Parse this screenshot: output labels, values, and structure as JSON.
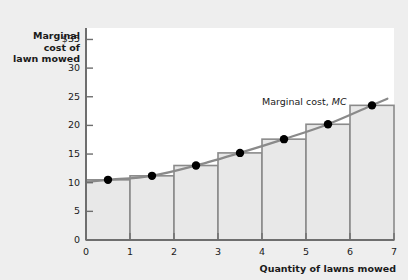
{
  "axes": {
    "y_title": "Marginal\ncost of\nlawn mowed",
    "x_title": "Quantity of lawns mowed",
    "curve_label_prefix": "Marginal cost, ",
    "curve_label_symbol": "MC"
  },
  "colors": {
    "background": "#eeeeee",
    "plot_area": "#ffffff",
    "bar_fill": "#e8e8e8",
    "bar_stroke": "#8a8a8a",
    "curve": "#8a8a8a",
    "axis": "#6e6e6e",
    "dot": "#000000",
    "text": "#1a1a1a"
  },
  "chart_data": {
    "type": "bar",
    "title": "",
    "xlabel": "Quantity of lawns mowed",
    "ylabel": "Marginal cost of lawn mowed",
    "xlim": [
      0,
      7
    ],
    "ylim": [
      0,
      37
    ],
    "grid": false,
    "legend": "none",
    "xticks": [
      0,
      1,
      2,
      3,
      4,
      5,
      6,
      7
    ],
    "xtick_labels": [
      "0",
      "1",
      "2",
      "3",
      "4",
      "5",
      "6",
      "7"
    ],
    "yticks": [
      0,
      5,
      10,
      15,
      20,
      25,
      30,
      35
    ],
    "ytick_labels": [
      "0",
      "5",
      "10",
      "15",
      "20",
      "25",
      "30",
      "$35"
    ],
    "categories": [
      "0-1",
      "1-2",
      "2-3",
      "3-4",
      "4-5",
      "5-6",
      "6-7"
    ],
    "values": [
      10.5,
      11.2,
      13.0,
      15.2,
      17.6,
      20.2,
      23.5
    ],
    "series": [
      {
        "name": "Marginal cost, MC",
        "type": "line",
        "points": [
          {
            "x": 0.5,
            "y": 10.5
          },
          {
            "x": 1.5,
            "y": 11.2
          },
          {
            "x": 2.5,
            "y": 13.0
          },
          {
            "x": 3.5,
            "y": 15.2
          },
          {
            "x": 4.5,
            "y": 17.6
          },
          {
            "x": 5.5,
            "y": 20.2
          },
          {
            "x": 6.5,
            "y": 23.5
          }
        ]
      }
    ],
    "annotations": [
      {
        "text": "Marginal cost, MC",
        "x": 5.0,
        "y": 27.5
      }
    ]
  }
}
